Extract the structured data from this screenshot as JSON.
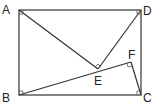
{
  "diagram": {
    "type": "geometry",
    "points": {
      "A": {
        "label": "A",
        "x": 19,
        "y": 10
      },
      "B": {
        "label": "B",
        "x": 19,
        "y": 95
      },
      "C": {
        "label": "C",
        "x": 141,
        "y": 95
      },
      "D": {
        "label": "D",
        "x": 141,
        "y": 10
      },
      "E": {
        "label": "E",
        "x": 98,
        "y": 69
      },
      "F": {
        "label": "F",
        "x": 131,
        "y": 62
      }
    },
    "segments": [
      "AB",
      "BC",
      "CD",
      "DA",
      "AE",
      "DE",
      "BF",
      "CF"
    ],
    "right_angles": [
      "A",
      "B",
      "C",
      "D",
      "E",
      "F"
    ]
  }
}
